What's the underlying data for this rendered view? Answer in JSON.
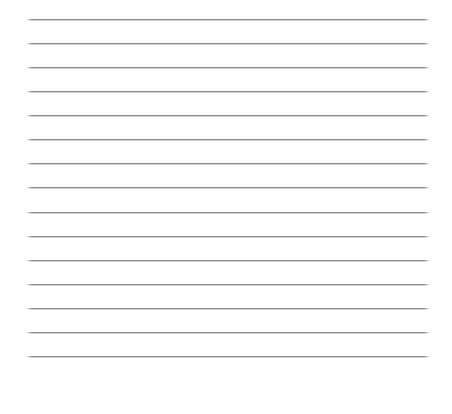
{
  "page": {
    "background_color": "#ffffff",
    "width_px": 452,
    "height_px": 414,
    "ruled_lines": {
      "count": 15,
      "first_y_px": 19,
      "spacing_px": 24.07,
      "left_px": 27,
      "width_px": 402,
      "thickness_px": 2,
      "color_top": "#8e8e8e",
      "color_bottom": "#d2d2d2"
    },
    "text_content": ""
  }
}
